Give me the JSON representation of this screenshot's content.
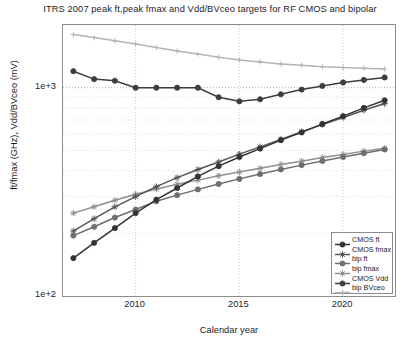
{
  "chart_data": {
    "type": "line",
    "title": "ITRS 2007 peak ft,peak fmax and Vdd/BVceo targets for RF CMOS and bipolar",
    "xlabel": "Calendar year",
    "ylabel": "ft/fmax (GHz), Vdd/BVceo (mV)",
    "yscale": "log",
    "ylim": [
      100,
      2000
    ],
    "xlim": [
      2006.5,
      2022.5
    ],
    "grid": true,
    "legend_position": "lower right",
    "ytick_labels": [
      "1e+3",
      "1e+2"
    ],
    "xtick_labels": [
      "2010",
      "2015",
      "2020"
    ],
    "x": [
      2007,
      2008,
      2009,
      2010,
      2011,
      2012,
      2013,
      2014,
      2015,
      2016,
      2017,
      2018,
      2019,
      2020,
      2021,
      2022
    ],
    "series": [
      {
        "name": "CMOS ft",
        "color": "#333333",
        "marker": "circle",
        "values": [
          152,
          180,
          212,
          250,
          290,
          330,
          375,
          420,
          465,
          510,
          560,
          610,
          670,
          730,
          800,
          870
        ]
      },
      {
        "name": "CMOS fmax",
        "color": "#555555",
        "marker": "star",
        "values": [
          205,
          235,
          268,
          300,
          335,
          370,
          405,
          440,
          480,
          520,
          565,
          615,
          665,
          720,
          780,
          840
        ]
      },
      {
        "name": "bip ft",
        "color": "#6e6e6e",
        "marker": "circle",
        "values": [
          195,
          215,
          238,
          260,
          285,
          305,
          325,
          345,
          365,
          385,
          405,
          425,
          445,
          465,
          485,
          505
        ]
      },
      {
        "name": "bip fmax",
        "color": "#8f8f8f",
        "marker": "star",
        "values": [
          250,
          268,
          288,
          308,
          326,
          344,
          360,
          378,
          394,
          410,
          428,
          444,
          462,
          478,
          496,
          512
        ]
      },
      {
        "name": "CMOS Vdd",
        "color": "#3d3d3d",
        "marker": "circle",
        "values": [
          1200,
          1100,
          1080,
          1000,
          1000,
          1000,
          1000,
          900,
          860,
          880,
          930,
          980,
          1020,
          1060,
          1090,
          1120
        ]
      },
      {
        "name": "bip BVceo",
        "color": "#b4b4b4",
        "marker": "plus",
        "values": [
          1800,
          1740,
          1680,
          1620,
          1560,
          1500,
          1450,
          1400,
          1360,
          1330,
          1300,
          1280,
          1260,
          1250,
          1240,
          1230
        ]
      }
    ]
  },
  "legend": {
    "items": [
      {
        "label": "CMOS ft"
      },
      {
        "label": "CMOS fmax"
      },
      {
        "label": "bip ft"
      },
      {
        "label": "bip fmax"
      },
      {
        "label": "CMOS Vdd"
      },
      {
        "label": "bip BVceo"
      }
    ]
  }
}
